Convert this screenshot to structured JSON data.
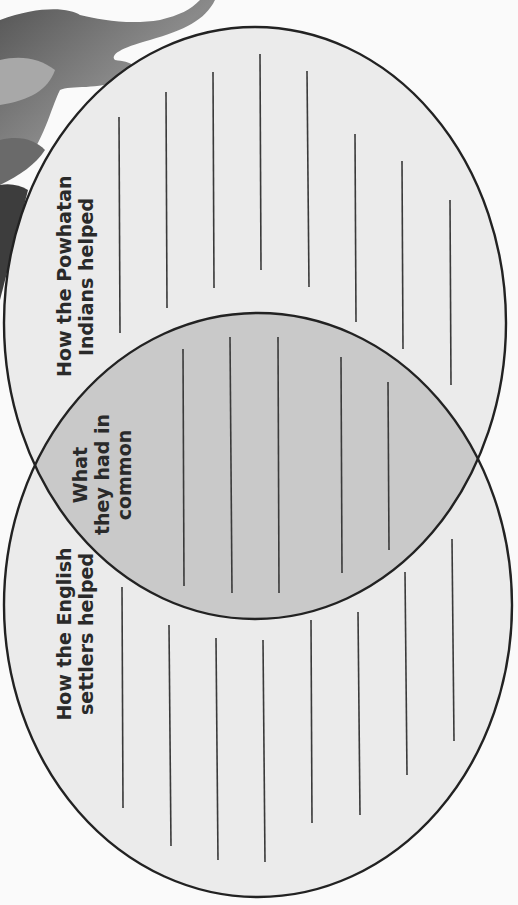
{
  "diagram": {
    "type": "venn",
    "orientation": "rotated-90-ccw",
    "colors": {
      "page_background": "#fafafa",
      "circle_fill": "#ebebeb",
      "overlap_fill": "#c9c9c9",
      "outline": "#222222",
      "writing_line": "#3a3a3a",
      "text": "#2a2a2a"
    },
    "regions": {
      "powhatan": {
        "label_lines": [
          "How the Powhatan",
          "Indians helped"
        ],
        "writing_lines": 8
      },
      "common": {
        "label_lines": [
          "What",
          "they had in",
          "common"
        ],
        "writing_lines": 5
      },
      "english": {
        "label_lines": [
          "How the English",
          "settlers helped"
        ],
        "writing_lines": 8
      }
    }
  }
}
